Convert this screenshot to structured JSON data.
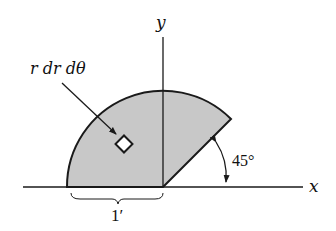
{
  "diagram": {
    "axis_x_label": "x",
    "axis_y_label": "y",
    "element_label": "r dr dθ",
    "angle_label": "45°",
    "radius_label": "1′",
    "region_fill": "#c8c8c8",
    "stroke": "#1a1a1a"
  }
}
